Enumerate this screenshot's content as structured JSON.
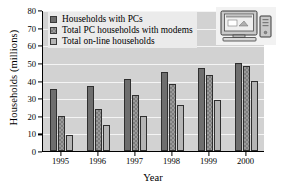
{
  "chart_data": {
    "type": "bar",
    "title": "",
    "xlabel": "Year",
    "ylabel": "Households (millions)",
    "categories": [
      "1995",
      "1996",
      "1997",
      "1998",
      "1999",
      "2000"
    ],
    "series": [
      {
        "name": "Households with PCs",
        "values": [
          35,
          37,
          41,
          45,
          47,
          50
        ],
        "color": "#6e6e6e"
      },
      {
        "name": "Total PC households with modems",
        "values": [
          20,
          24,
          32,
          38,
          43,
          48
        ],
        "color": "#9a9a9a"
      },
      {
        "name": "Total on-line households",
        "values": [
          9,
          15,
          20,
          26,
          29,
          40
        ],
        "color": "#b5b5b5"
      }
    ],
    "ylim": [
      0,
      80
    ],
    "ytick_step": 10,
    "yticks": [
      "0",
      "10",
      "20",
      "30",
      "40",
      "50",
      "60",
      "70",
      "80"
    ],
    "grid": true,
    "legend_position": "top-left"
  },
  "legend": {
    "items": [
      {
        "label": "Households with PCs"
      },
      {
        "label": "Total PC households with modems"
      },
      {
        "label": "Total on-line households"
      }
    ]
  },
  "decoration": {
    "icon_name": "desktop-computer-icon"
  }
}
